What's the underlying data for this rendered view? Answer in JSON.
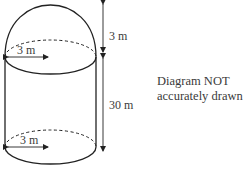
{
  "diagram": {
    "type": "solid-figure",
    "shape": "cylinder with hemispherical dome",
    "labels": {
      "dome_radius": "3 m",
      "cylinder_radius": "3 m",
      "dome_height": "3 m",
      "cylinder_height": "30 m"
    },
    "note_line1": "Diagram NOT",
    "note_line2": "accurately drawn",
    "colors": {
      "stroke": "#222222",
      "text": "#3a3a3a",
      "background": "#ffffff"
    }
  }
}
